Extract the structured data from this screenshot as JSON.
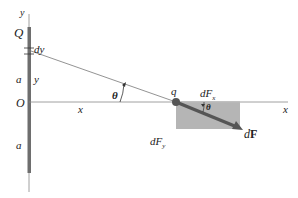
{
  "diagram": {
    "labels": {
      "y_axis": "y",
      "charge": "Q",
      "dy": "dy",
      "a_upper": "a",
      "y_dist": "y",
      "origin": "O",
      "a_lower": "a",
      "x_dist": "x",
      "x_axis": "x",
      "theta_main": "θ",
      "point_charge": "q",
      "dFx_base": "dF",
      "dFx_sub": "x",
      "dFy_base": "dF",
      "dFy_sub": "y",
      "theta_small": "θ",
      "dF_prefix": "d",
      "dF_vec": "F"
    },
    "colors": {
      "rod": "#6e6e6e",
      "axis": "#888888",
      "line": "#777777",
      "box_fill": "#a8a8a8",
      "arrow": "#555555",
      "dot": "#555555"
    }
  }
}
